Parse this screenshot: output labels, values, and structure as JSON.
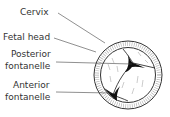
{
  "diagram": {
    "labels": {
      "cervix": "Cervix",
      "fetal_head": "Fetal head",
      "posterior_1": "Posterior",
      "posterior_2": "fontanelle",
      "anterior_1": "Anterior",
      "anterior_2": "fontanelle"
    },
    "colors": {
      "line": "#333333",
      "fontanelle": "#111111",
      "background": "#ffffff"
    }
  }
}
